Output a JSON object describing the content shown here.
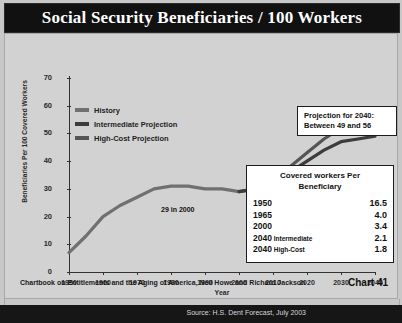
{
  "header": {
    "title": "Social Security Beneficiaries / 100 Workers"
  },
  "legend": {
    "items": [
      {
        "label": "History",
        "color": "#707070"
      },
      {
        "label": "Intermediate Projection",
        "color": "#3c3c3c"
      },
      {
        "label": "High-Cost Projection",
        "color": "#555555"
      }
    ]
  },
  "callouts": {
    "projection": {
      "line1": "Projection for 2040:",
      "line2": "Between 49 and 56"
    },
    "annotation": "29 in 2000"
  },
  "table": {
    "title_line1": "Covered workers Per",
    "title_line2": "Beneficiary",
    "rows": [
      {
        "year": "1950",
        "qualifier": "",
        "value": "16.5"
      },
      {
        "year": "1965",
        "qualifier": "",
        "value": "4.0"
      },
      {
        "year": "2000",
        "qualifier": "",
        "value": "3.4"
      },
      {
        "year": "2040",
        "qualifier": "Intermediate",
        "value": "2.1"
      },
      {
        "year": "2040",
        "qualifier": "High-Cost",
        "value": "1.8"
      }
    ]
  },
  "footer": {
    "note": "Chartbook on Entitlements and the Aging of America, Neil Howe and Richard Jackson",
    "chart_number": "Chart 41",
    "source": "Source: H.S. Dent Forecast, July 2003"
  },
  "chart_data": {
    "type": "line",
    "title": "Social Security Beneficiaries / 100 Workers",
    "xlabel": "Year",
    "ylabel": "Beneficiaries Per 100 Covered Workers",
    "xlim": [
      1950,
      2040
    ],
    "ylim": [
      0,
      70
    ],
    "yticks": [
      0,
      10,
      20,
      30,
      40,
      50,
      60,
      70
    ],
    "xticks": [
      1950,
      1960,
      1970,
      1980,
      1990,
      2000,
      2010,
      2020,
      2030,
      2040
    ],
    "grid": false,
    "legend_position": "upper-left",
    "series": [
      {
        "name": "History",
        "color": "#707070",
        "x": [
          1950,
          1955,
          1960,
          1965,
          1970,
          1975,
          1980,
          1985,
          1990,
          1995,
          2000
        ],
        "values": [
          7,
          13,
          20,
          24,
          27,
          30,
          31,
          31,
          30,
          30,
          29
        ]
      },
      {
        "name": "Intermediate Projection",
        "color": "#3c3c3c",
        "x": [
          2000,
          2005,
          2010,
          2015,
          2020,
          2025,
          2030,
          2035,
          2040
        ],
        "values": [
          29,
          30,
          32,
          36,
          40,
          44,
          47,
          48,
          49
        ]
      },
      {
        "name": "High-Cost Projection",
        "color": "#555555",
        "x": [
          2000,
          2005,
          2010,
          2015,
          2020,
          2025,
          2030,
          2035,
          2040
        ],
        "values": [
          29,
          30,
          33,
          38,
          43,
          48,
          52,
          55,
          56
        ]
      }
    ],
    "annotations": [
      {
        "text": "29 in 2000",
        "x": 2000,
        "y": 29
      },
      {
        "text": "Projection for 2040: Between 49 and 56",
        "x": 2035,
        "y": 62
      }
    ]
  }
}
